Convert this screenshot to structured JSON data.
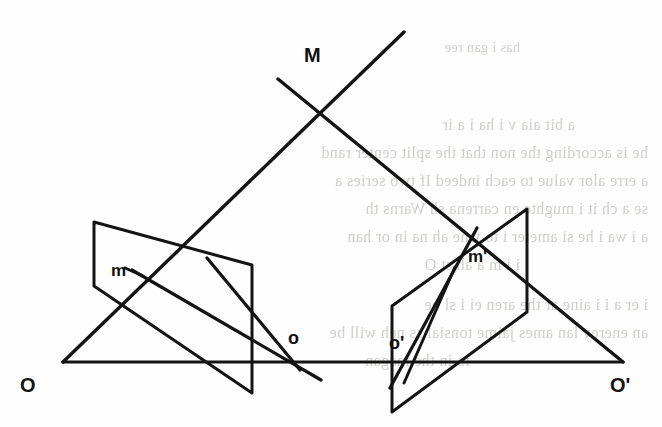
{
  "figure": {
    "kind": "line-diagram",
    "stroke_color": "#141414",
    "background_color": "#fefefe",
    "ghost_text_color": "#c9c6c2",
    "width": 662,
    "height": 427
  },
  "labels": {
    "scene_point": "M",
    "left_center": "O",
    "right_center": "O'",
    "left_image_point": "m",
    "right_image_point": "m'",
    "left_principal_point": "o",
    "right_principal_point": "o'"
  },
  "label_positions": {
    "scene_point": {
      "x": 304,
      "y": 44,
      "size": "cap"
    },
    "left_center": {
      "x": 20,
      "y": 374,
      "size": "cap"
    },
    "right_center": {
      "x": 610,
      "y": 374,
      "size": "cap"
    },
    "left_image_point": {
      "x": 111,
      "y": 261,
      "size": "low"
    },
    "right_image_point": {
      "x": 468,
      "y": 247,
      "size": "low"
    },
    "left_principal_point": {
      "x": 288,
      "y": 328,
      "size": "mid"
    },
    "right_principal_point": {
      "x": 389,
      "y": 333,
      "size": "mid"
    }
  },
  "geometry": {
    "baseline": {
      "name": "baseline-OO-prime",
      "x1": 63,
      "y1": 362,
      "x2": 623,
      "y2": 362,
      "width": 3.2
    },
    "rays": [
      {
        "name": "ray-O-to-M",
        "x1": 63,
        "y1": 362,
        "x2": 404,
        "y2": 32,
        "width": 3.4
      },
      {
        "name": "ray-M-to-O-prime",
        "x1": 278,
        "y1": 79,
        "x2": 623,
        "y2": 362,
        "width": 3.4
      }
    ],
    "left_plane": {
      "name": "left-image-plane",
      "points": "94,222 252,265 252,393 94,286",
      "width": 3.0
    },
    "right_plane": {
      "name": "right-image-plane",
      "points": "527,209 527,312 392,412 392,306",
      "width": 3.0
    },
    "left_plane_segments": [
      {
        "name": "left-plane-chord-m-to-o",
        "x1": 132,
        "y1": 270,
        "x2": 321,
        "y2": 380,
        "width": 3.2
      },
      {
        "name": "left-plane-chord-upper",
        "x1": 207,
        "y1": 258,
        "x2": 300,
        "y2": 370,
        "width": 3.2
      },
      {
        "name": "left-plane-tick-m",
        "x1": 125,
        "y1": 268,
        "x2": 143,
        "y2": 276,
        "width": 3.0
      }
    ],
    "right_plane_segments": [
      {
        "name": "right-plane-chord-o-prime-to-m-prime",
        "x1": 390,
        "y1": 388,
        "x2": 477,
        "y2": 228,
        "width": 3.2
      },
      {
        "name": "right-plane-chord-inner",
        "x1": 404,
        "y1": 383,
        "x2": 455,
        "y2": 267,
        "width": 3.0
      }
    ],
    "crossing_point": {
      "name": "rays-crossing-M",
      "x": 317,
      "y": 116
    }
  },
  "ghost_text": {
    "note": "faint show-through text from reverse of printed page, mirrored and illegible",
    "lines": [
      {
        "text": "has i gan ree",
        "x": 520,
        "y": 40,
        "size": 14
      },
      {
        "text": "a bit aia v i ha i a ir",
        "x": 575,
        "y": 116,
        "size": 16
      },
      {
        "text": "he is according the non that the split center rand",
        "x": 648,
        "y": 144,
        "size": 16
      },
      {
        "text": "a erre alor value to each indeed If two series a",
        "x": 648,
        "y": 172,
        "size": 16
      },
      {
        "text": "se a ch it i mughte en carrena sh Warns th",
        "x": 648,
        "y": 200,
        "size": 16
      },
      {
        "text": "a i wa i he si ameter i to wne ah na in or han",
        "x": 648,
        "y": 228,
        "size": 16
      },
      {
        "text": "i i m a ah st O",
        "x": 520,
        "y": 256,
        "size": 16
      },
      {
        "text": "i er a i i aine ar the aren ei i sl be",
        "x": 648,
        "y": 296,
        "size": 16
      },
      {
        "text": "an enerey lan ames jaime tonsial ss neh will be",
        "x": 648,
        "y": 324,
        "size": 16
      },
      {
        "text": "io in the magan-",
        "x": 470,
        "y": 352,
        "size": 16
      }
    ]
  }
}
